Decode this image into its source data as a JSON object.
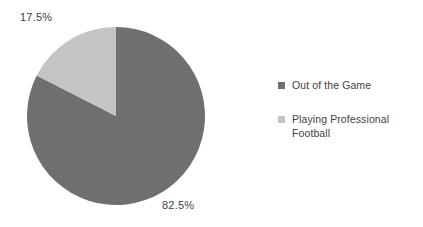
{
  "chart_data": {
    "type": "pie",
    "title": "",
    "subtitle": "",
    "xlabel": "",
    "ylabel": "",
    "legend_position": "right",
    "grid": false,
    "categories": [
      "Out of the Game",
      "Playing Professional Football"
    ],
    "values": [
      82.5,
      17.5
    ],
    "value_unit": "%",
    "data_labels": [
      "82.5%",
      "17.5%"
    ],
    "colors": [
      "#6f6f6f",
      "#c4c4c4"
    ],
    "start_angle_deg": 0,
    "direction": "counterclockwise",
    "slices": [
      {
        "name": "Out of the Game",
        "value": 82.5,
        "label": "82.5%",
        "color": "#6f6f6f",
        "start_deg": 0,
        "sweep_deg": 297
      },
      {
        "name": "Playing Professional Football",
        "value": 17.5,
        "label": "17.5%",
        "color": "#c4c4c4",
        "start_deg": 297,
        "sweep_deg": 63
      }
    ]
  },
  "labels": {
    "small_slice": "17.5%",
    "large_slice": "82.5%"
  },
  "legend": {
    "items": [
      {
        "label": "Out of the Game",
        "color": "#6f6f6f",
        "marker": "square-marker"
      },
      {
        "label": "Playing Professional Football",
        "color": "#c4c4c4",
        "marker": "square-marker"
      }
    ]
  },
  "colors": {
    "background": "#ffffff",
    "text": "#3f3f3f",
    "series_dark": "#6f6f6f",
    "series_light": "#c4c4c4"
  }
}
